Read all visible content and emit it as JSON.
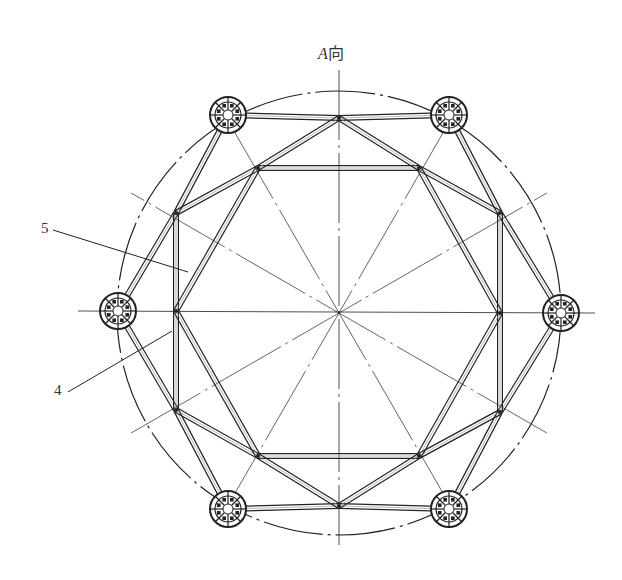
{
  "figure": {
    "title_letter": "A",
    "title_suffix": "向",
    "callouts": [
      {
        "id": "5",
        "label": "5",
        "anchor": [
          53,
          230
        ],
        "target": [
          188,
          272
        ]
      },
      {
        "id": "4",
        "label": "4",
        "anchor": [
          68,
          392
        ],
        "target": [
          172,
          331
        ]
      }
    ],
    "center": [
      339,
      313
    ],
    "outer_circle_radius": 222,
    "pier_radius": 18,
    "piers": [
      [
        228,
        115
      ],
      [
        449,
        115
      ],
      [
        561,
        313
      ],
      [
        449,
        509
      ],
      [
        228,
        509
      ],
      [
        118,
        311
      ]
    ],
    "top_mid": [
      339,
      118
    ],
    "bottom_mid": [
      339,
      506
    ],
    "inner_vertices": [
      [
        258,
        168
      ],
      [
        419,
        168
      ],
      [
        500,
        213
      ],
      [
        500,
        313
      ],
      [
        500,
        412
      ],
      [
        419,
        456
      ],
      [
        258,
        456
      ],
      [
        176,
        410
      ],
      [
        176,
        311
      ],
      [
        176,
        213
      ]
    ],
    "colors": {
      "line": "#222222",
      "background": "#ffffff"
    }
  }
}
